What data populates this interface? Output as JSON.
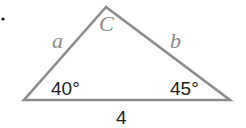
{
  "bullet": "•",
  "triangle": {
    "vertices": {
      "apex": [
        106,
        7
      ],
      "left": [
        24,
        100
      ],
      "right": [
        230,
        100
      ]
    },
    "stroke_color": "#8c8c8c",
    "side_labels": {
      "left": "a",
      "right": "b",
      "base": "4"
    },
    "vertex_label_apex": "C",
    "angles": {
      "left": "40°",
      "right": "45°"
    }
  }
}
